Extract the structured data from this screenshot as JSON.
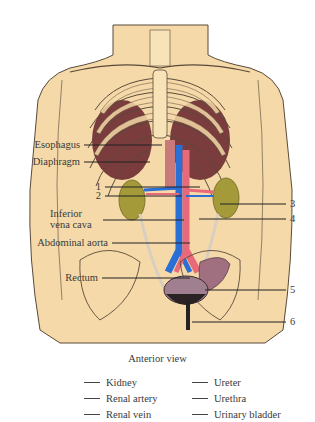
{
  "figure": {
    "view": "Anterior view",
    "colors": {
      "skin": "#f5d9a8",
      "outline": "#5a4a3a",
      "muscle": "#7a3c3c",
      "kidney": "#a59a3a",
      "vein": "#2a6fd6",
      "artery": "#e86a7a",
      "bladder": "#a08090"
    },
    "left_labels": [
      {
        "id": "esophagus",
        "text": "Esophagus"
      },
      {
        "id": "diaphragm",
        "text": "Diaphragm"
      },
      {
        "id": "num1",
        "text": "1"
      },
      {
        "id": "num2",
        "text": "2"
      },
      {
        "id": "ivc_line1",
        "text": "Inferior"
      },
      {
        "id": "ivc_line2",
        "text": "vena cava"
      },
      {
        "id": "aorta",
        "text": "Abdominal aorta"
      },
      {
        "id": "rectum",
        "text": "Rectum"
      }
    ],
    "right_labels": [
      {
        "id": "num3",
        "text": "3"
      },
      {
        "id": "num4",
        "text": "4"
      },
      {
        "id": "num5",
        "text": "5"
      },
      {
        "id": "num6",
        "text": "6"
      }
    ]
  },
  "key": {
    "left": [
      "Kidney",
      "Renal artery",
      "Renal vein"
    ],
    "right": [
      "Ureter",
      "Urethra",
      "Urinary bladder"
    ]
  }
}
